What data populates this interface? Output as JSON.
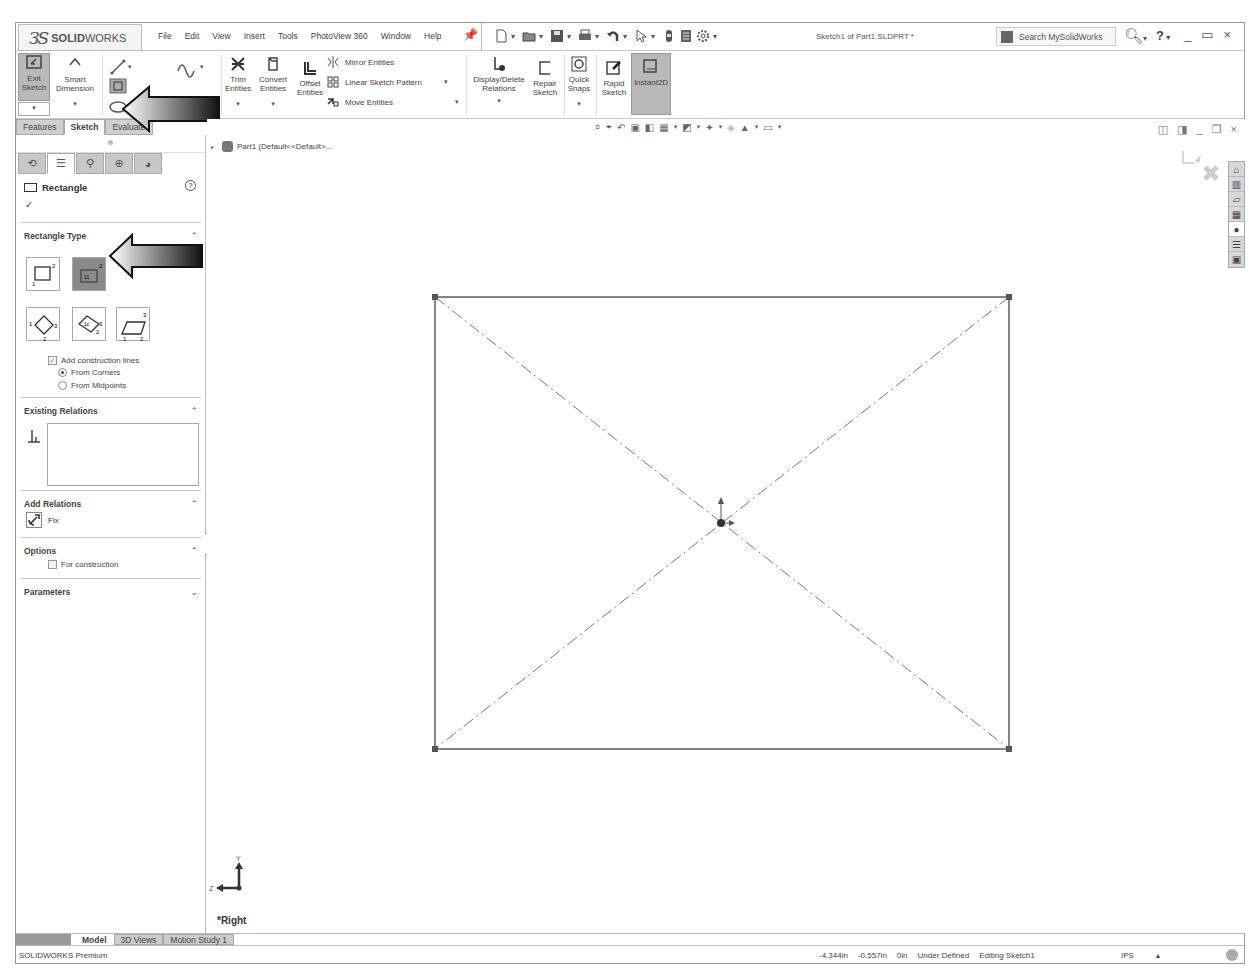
{
  "app": {
    "logo_prefix": "3S",
    "logo_bold": "SOLID",
    "logo_light": "WORKS",
    "menu": [
      "File",
      "Edit",
      "View",
      "Insert",
      "Tools",
      "PhotoView 360",
      "Window",
      "Help"
    ],
    "document_title": "Sketch1 of Part1.SLDPRT *",
    "search_placeholder": "Search MySolidWorks",
    "help_label": "?",
    "window_controls": [
      "_",
      "▭",
      "×"
    ]
  },
  "quick_access": [
    "new-document",
    "open",
    "save",
    "print",
    "undo",
    "select",
    "rebuild",
    "file-properties",
    "options"
  ],
  "ribbon": {
    "exit_sketch": "Exit Sketch",
    "smart_dimension": "Smart Dimension",
    "trim_entities": "Trim Entities",
    "convert_entities": "Convert Entities",
    "offset_entities": "Offset Entities",
    "mirror_entities": "Mirror Entities",
    "linear_sketch_pattern": "Linear Sketch Pattern",
    "move_entities": "Move Entities",
    "display_delete_relations": "Display/Delete Relations",
    "repair_sketch": "Repair Sketch",
    "quick_snaps": "Quick Snaps",
    "rapid_sketch": "Rapid Sketch",
    "instant2d": "Instant2D"
  },
  "command_tabs": [
    {
      "label": "Features",
      "active": false
    },
    {
      "label": "Sketch",
      "active": true
    },
    {
      "label": "Evaluate",
      "active": false
    }
  ],
  "property_manager": {
    "title": "Rectangle",
    "help": "?",
    "ok": "✓",
    "rectangle_type": {
      "heading": "Rectangle Type",
      "types": [
        "corner-rectangle",
        "center-rectangle",
        "3-point-corner-rectangle",
        "3-point-center-rectangle",
        "parallelogram"
      ],
      "selected": "center-rectangle",
      "add_construction_lines": "Add construction lines",
      "from_corners": "From Corners",
      "from_midpoints": "From Midpoints"
    },
    "existing_relations": {
      "heading": "Existing Relations"
    },
    "add_relations": {
      "heading": "Add Relations",
      "fix": "Fix"
    },
    "options": {
      "heading": "Options",
      "for_construction": "For construction"
    },
    "parameters": {
      "heading": "Parameters"
    }
  },
  "graphics": {
    "tree_item": "Part1  (Default<<Default>...",
    "view_label": "*Right",
    "triad": {
      "y": "Y",
      "z": "Z"
    }
  },
  "bottom_tabs": [
    {
      "label": "Model",
      "active": true
    },
    {
      "label": "3D Views",
      "active": false
    },
    {
      "label": "Motion Study 1",
      "active": false
    }
  ],
  "status_bar": {
    "edition": "SOLIDWORKS Premium",
    "x": "-4.344in",
    "y": "-0.557in",
    "z": "0in",
    "definition": "Under Defined",
    "mode": "Editing Sketch1",
    "units": "IPS",
    "units_dropdown": "▴"
  }
}
